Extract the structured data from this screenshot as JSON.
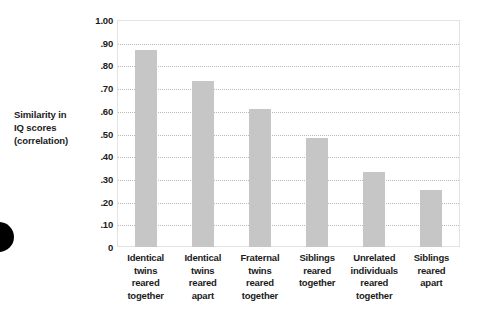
{
  "chart_data": {
    "type": "bar",
    "title": "",
    "xlabel": "",
    "ylabel": "Similarity in IQ scores (correlation)",
    "ylim": [
      0,
      1.0
    ],
    "grid": true,
    "legend": "none",
    "bar_color": "#c6c6c6",
    "categories": [
      "Identical twins reared together",
      "Identical twins reared apart",
      "Fraternal twins reared together",
      "Siblings reared together",
      "Unrelated individuals reared together",
      "Siblings reared apart"
    ],
    "values": [
      0.87,
      0.73,
      0.61,
      0.48,
      0.33,
      0.25
    ],
    "ytick_values": [
      1.0,
      0.9,
      0.8,
      0.7,
      0.6,
      0.5,
      0.4,
      0.3,
      0.2,
      0.1,
      0
    ],
    "ytick_labels": [
      "1.00",
      ".90",
      ".80",
      ".70",
      ".60",
      ".50",
      ".40",
      ".30",
      ".20",
      ".10",
      "0"
    ]
  },
  "axis_title": {
    "line1": "Similarity in",
    "line2": "IQ scores",
    "line3": "(correlation)"
  },
  "category_lines": [
    [
      "Identical",
      "twins",
      "reared",
      "together"
    ],
    [
      "Identical",
      "twins",
      "reared",
      "apart"
    ],
    [
      "Fraternal",
      "twins",
      "reared",
      "together"
    ],
    [
      "Siblings",
      "reared",
      "together"
    ],
    [
      "Unrelated",
      "individuals",
      "reared",
      "together"
    ],
    [
      "Siblings",
      "reared",
      "apart"
    ]
  ]
}
